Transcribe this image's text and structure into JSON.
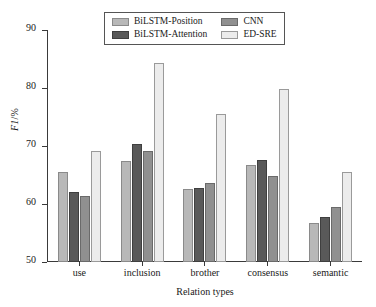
{
  "chart_data": {
    "type": "bar",
    "title": "",
    "subtitle": "",
    "xlabel": "Relation types",
    "ylabel": "F1/%",
    "ylim": [
      50,
      90
    ],
    "yticks": [
      50,
      60,
      70,
      80,
      90
    ],
    "ytick_labels": [
      "50",
      "60",
      "70",
      "80",
      "90"
    ],
    "grid": false,
    "legend_position": "top-center",
    "categories": [
      "use",
      "inclusion",
      "brother",
      "consensus",
      "semantic"
    ],
    "series": [
      {
        "name": "BiLSTM-Position",
        "color": "#b8b8b8",
        "values": [
          65.5,
          67.5,
          62.6,
          66.8,
          56.8
        ]
      },
      {
        "name": "BiLSTM-Attention",
        "color": "#595959",
        "values": [
          62.0,
          70.4,
          62.8,
          67.6,
          57.8
        ]
      },
      {
        "name": "CNN",
        "color": "#909090",
        "values": [
          61.3,
          69.2,
          63.6,
          64.8,
          59.5
        ]
      },
      {
        "name": "ED-SRE",
        "color": "#ececec",
        "values": [
          69.2,
          84.3,
          75.6,
          79.8,
          65.5
        ]
      }
    ]
  },
  "legend": {
    "entries": [
      {
        "label": "BiLSTM-Position",
        "swatch": "s0"
      },
      {
        "label": "CNN",
        "swatch": "s2"
      },
      {
        "label": "BiLSTM-Attention",
        "swatch": "s1"
      },
      {
        "label": "ED-SRE",
        "swatch": "s3"
      }
    ]
  },
  "axes": {
    "y_title_italic": "F1",
    "y_title_rest": "/%"
  }
}
